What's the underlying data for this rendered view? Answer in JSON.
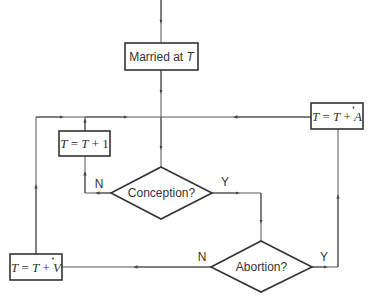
{
  "diagram": {
    "type": "flowchart",
    "nodes": {
      "married": {
        "shape": "rect",
        "text_main": "Married at ",
        "text_var": "T"
      },
      "increment": {
        "shape": "rect",
        "var": "T",
        "eq": "=",
        "var2": "T",
        "rest": "+ 1"
      },
      "add_a": {
        "shape": "rect",
        "var": "T",
        "eq": "=",
        "var2": "T",
        "plus": "+",
        "var3": "A",
        "dot": "·"
      },
      "add_v": {
        "shape": "rect",
        "var": "T",
        "eq": "=",
        "var2": "T",
        "plus": "+",
        "var3": "V",
        "dot": "·"
      },
      "conception": {
        "shape": "diamond",
        "text": "Conception?"
      },
      "abortion": {
        "shape": "diamond",
        "text": "Abortion?"
      }
    },
    "edge_labels": {
      "conception_no": "N",
      "conception_yes": "Y",
      "abortion_no": "N",
      "abortion_yes": "Y"
    },
    "colors": {
      "line": "#555555",
      "border": "#333333",
      "text": "#333333",
      "background": "#ffffff"
    }
  }
}
